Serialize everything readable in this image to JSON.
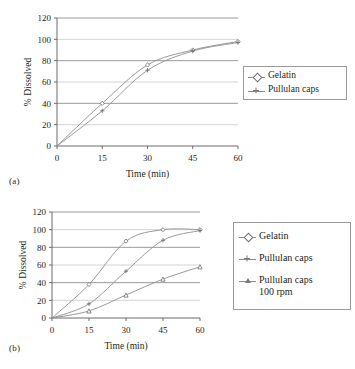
{
  "figure": {
    "panel_a_label": "(a)",
    "panel_b_label": "(b)"
  },
  "chart_data": [
    {
      "id": "panel-a",
      "type": "line",
      "title": "",
      "xlabel": "Time (min)",
      "ylabel": "% Dissolved",
      "x": [
        0,
        15,
        30,
        45,
        60
      ],
      "xticks": [
        "0",
        "15",
        "30",
        "45",
        "60"
      ],
      "yticks": [
        "0",
        "20",
        "40",
        "60",
        "80",
        "100",
        "120"
      ],
      "xlim": [
        0,
        60
      ],
      "ylim": [
        0,
        120
      ],
      "grid": "horizontal",
      "legend_position": "right",
      "series": [
        {
          "name": "Gelatin",
          "marker": "diamond",
          "values": [
            0,
            40,
            76,
            90,
            98
          ]
        },
        {
          "name": "Pullulan caps",
          "marker": "cross",
          "values": [
            0,
            33,
            71,
            89,
            97
          ]
        }
      ]
    },
    {
      "id": "panel-b",
      "type": "line",
      "title": "",
      "xlabel": "Time (min)",
      "ylabel": "% Dissolved",
      "x": [
        0,
        15,
        30,
        45,
        60
      ],
      "xticks": [
        "0",
        "15",
        "30",
        "45",
        "60"
      ],
      "yticks": [
        "0",
        "20",
        "40",
        "60",
        "80",
        "100",
        "120"
      ],
      "xlim": [
        0,
        60
      ],
      "ylim": [
        0,
        120
      ],
      "grid": "horizontal",
      "legend_position": "right",
      "series": [
        {
          "name": "Gelatin",
          "marker": "diamond",
          "values": [
            0,
            38,
            87,
            100,
            100
          ]
        },
        {
          "name": "Pullulan caps",
          "marker": "cross",
          "values": [
            0,
            16,
            53,
            88,
            99
          ]
        },
        {
          "name": "Pullulan caps\n100 rpm",
          "marker": "triangle",
          "values": [
            0,
            8,
            26,
            44,
            58
          ]
        }
      ]
    }
  ],
  "legend_a": {
    "items": [
      {
        "label": "Gelatin"
      },
      {
        "label": "Pullulan caps"
      }
    ]
  },
  "legend_b": {
    "items": [
      {
        "label": "Gelatin"
      },
      {
        "label": "Pullulan caps"
      },
      {
        "label": "Pullulan caps\n100 rpm"
      }
    ]
  }
}
